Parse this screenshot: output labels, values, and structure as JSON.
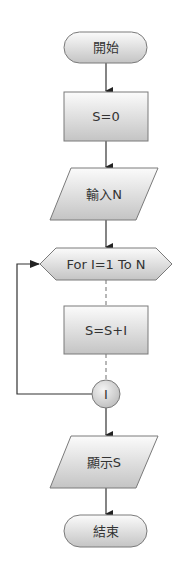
{
  "diagram": {
    "type": "flowchart",
    "nodes": {
      "start": {
        "shape": "terminator",
        "label": "開始"
      },
      "init": {
        "shape": "process",
        "label": "S=0"
      },
      "input": {
        "shape": "input-output",
        "label": "輸入N"
      },
      "loop": {
        "shape": "loop-hexagon",
        "label": "For I=1 To N"
      },
      "body": {
        "shape": "process",
        "label": "S=S+I"
      },
      "next": {
        "shape": "connector",
        "label": "I"
      },
      "output": {
        "shape": "input-output",
        "label": "顯示S"
      },
      "end": {
        "shape": "terminator",
        "label": "結束"
      }
    },
    "edges": [
      {
        "from": "開始",
        "to": "S=0",
        "style": "solid-arrow"
      },
      {
        "from": "S=0",
        "to": "輸入N",
        "style": "solid-arrow"
      },
      {
        "from": "輸入N",
        "to": "For I=1 To N",
        "style": "solid-arrow"
      },
      {
        "from": "For I=1 To N",
        "to": "S=S+I",
        "style": "dashed"
      },
      {
        "from": "S=S+I",
        "to": "I",
        "style": "dashed"
      },
      {
        "from": "I",
        "to": "For I=1 To N",
        "style": "solid-arrow-loop-back"
      },
      {
        "from": "I",
        "to": "顯示S",
        "style": "solid-arrow"
      },
      {
        "from": "顯示S",
        "to": "結束",
        "style": "solid-arrow"
      }
    ],
    "colors": {
      "shape_fill_top": "#ffffff",
      "shape_fill_bottom": "#c4c4c4",
      "shape_stroke": "#7a7a7a",
      "line": "#333333",
      "text": "#333333"
    }
  }
}
